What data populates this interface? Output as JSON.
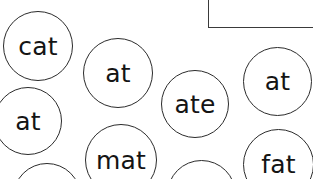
{
  "page": {
    "background_color": "#ffffff",
    "width": 313,
    "height": 179
  },
  "corner_rule": {
    "name": "corner-rule",
    "color": "#3a3a3a",
    "vertical": {
      "x": 208,
      "y": 0,
      "height": 28
    },
    "horizontal": {
      "x": 208,
      "y": 27,
      "width": 105
    }
  },
  "style": {
    "circle_stroke_color": "#2b2b2b",
    "circle_fill_color": "#ffffff",
    "text_color": "#141414"
  },
  "circles": [
    {
      "id": "circle-cat",
      "word": "cat",
      "x": 3,
      "y": 11,
      "size": 70,
      "font_size": 25,
      "text_offset_x": 0,
      "text_offset_y": 0
    },
    {
      "id": "circle-at-top-middle",
      "word": "at",
      "x": 83,
      "y": 38,
      "size": 70,
      "font_size": 25,
      "text_offset_x": 0,
      "text_offset_y": 0
    },
    {
      "id": "circle-at-top-right",
      "word": "at",
      "x": 243,
      "y": 47,
      "size": 69,
      "font_size": 25,
      "text_offset_x": 0,
      "text_offset_y": 0
    },
    {
      "id": "circle-ate",
      "word": "ate",
      "x": 161,
      "y": 70,
      "size": 68,
      "font_size": 25,
      "text_offset_x": 0,
      "text_offset_y": 0
    },
    {
      "id": "circle-at-left",
      "word": "at",
      "x": -6,
      "y": 87,
      "size": 68,
      "font_size": 25,
      "text_offset_x": 0,
      "text_offset_y": 0
    },
    {
      "id": "circle-mat",
      "word": "mat",
      "x": 85,
      "y": 124,
      "size": 72,
      "font_size": 25,
      "text_offset_x": 0,
      "text_offset_y": 0
    },
    {
      "id": "circle-fat",
      "word": "fat",
      "x": 243,
      "y": 129,
      "size": 71,
      "font_size": 25,
      "text_offset_x": 0,
      "text_offset_y": 0
    },
    {
      "id": "circle-bottom-center-partial",
      "word": "",
      "x": 167,
      "y": 160,
      "size": 69,
      "font_size": 25,
      "text_offset_x": 0,
      "text_offset_y": 0
    },
    {
      "id": "circle-bottom-left-partial",
      "word": "",
      "x": 13,
      "y": 163,
      "size": 68,
      "font_size": 25,
      "text_offset_x": 0,
      "text_offset_y": 0
    }
  ]
}
